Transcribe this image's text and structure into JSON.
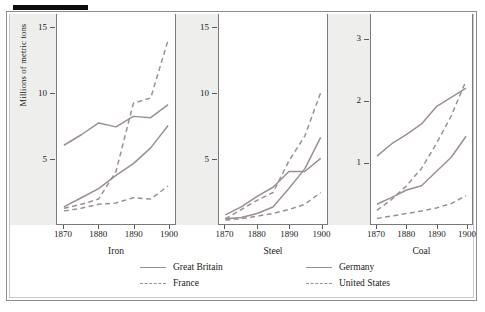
{
  "figure": {
    "ylabel": "Millions of metric tons"
  },
  "legend": {
    "entries": [
      {
        "name": "Great Britain",
        "style": "solid",
        "color": "#9b8f93"
      },
      {
        "name": "Germany",
        "style": "solid",
        "color": "#9b8f93"
      },
      {
        "name": "France",
        "style": "dashed",
        "color": "#9b8f93"
      },
      {
        "name": "United States",
        "style": "dashed",
        "color": "#9b8f93"
      }
    ]
  },
  "chart_data": {
    "type": "line",
    "title": "",
    "subtitle": "",
    "xlabel": "",
    "ylabel": "Millions of metric tons",
    "grid": false,
    "legend_position": "bottom",
    "panel_layout": "small-multiples-horizontal",
    "x": [
      1870,
      1875,
      1880,
      1885,
      1890,
      1895,
      1900
    ],
    "xlim": [
      1868,
      1902
    ],
    "xticks": [
      1870,
      1880,
      1890,
      1900
    ],
    "panels": [
      {
        "name": "Iron",
        "ylim": [
          0,
          16
        ],
        "yticks": [
          5,
          10,
          15
        ],
        "series": [
          {
            "name": "Great Britain",
            "style": "solid",
            "values": [
              6.0,
              6.8,
              7.7,
              7.4,
              8.2,
              8.1,
              9.1
            ]
          },
          {
            "name": "Germany",
            "style": "solid",
            "values": [
              1.3,
              2.0,
              2.7,
              3.7,
              4.6,
              5.8,
              7.5
            ]
          },
          {
            "name": "France",
            "style": "dashed",
            "values": [
              1.2,
              1.5,
              1.9,
              4.0,
              9.2,
              9.6,
              14.0
            ]
          },
          {
            "name": "United States",
            "style": "dashed",
            "values": [
              1.0,
              1.2,
              1.5,
              1.6,
              2.0,
              1.9,
              2.9
            ]
          }
        ]
      },
      {
        "name": "Steel",
        "ylim": [
          0,
          16
        ],
        "yticks": [
          5,
          10,
          15
        ],
        "series": [
          {
            "name": "Great Britain",
            "style": "solid",
            "values": [
              0.7,
              1.3,
              2.1,
              2.8,
              4.0,
              4.0,
              5.0
            ]
          },
          {
            "name": "Germany",
            "style": "solid",
            "values": [
              0.4,
              0.5,
              0.8,
              1.3,
              2.7,
              4.2,
              6.6
            ]
          },
          {
            "name": "France",
            "style": "dashed",
            "values": [
              0.4,
              1.1,
              1.8,
              2.4,
              4.8,
              6.7,
              10.0
            ]
          },
          {
            "name": "United States",
            "style": "dashed",
            "values": [
              0.3,
              0.4,
              0.6,
              0.8,
              1.1,
              1.5,
              2.4
            ]
          }
        ]
      },
      {
        "name": "Coal",
        "ylim": [
          0,
          3.4
        ],
        "yticks": [
          1,
          2,
          3
        ],
        "series": [
          {
            "name": "Great Britain",
            "style": "solid",
            "values": [
              1.1,
              1.3,
              1.45,
              1.62,
              1.9,
              2.05,
              2.2
            ]
          },
          {
            "name": "Germany",
            "style": "solid",
            "values": [
              0.32,
              0.43,
              0.55,
              0.62,
              0.85,
              1.08,
              1.42
            ]
          },
          {
            "name": "France",
            "style": "dashed",
            "values": [
              0.22,
              0.4,
              0.62,
              0.9,
              1.3,
              1.75,
              2.32
            ]
          },
          {
            "name": "United States",
            "style": "dashed",
            "values": [
              0.09,
              0.13,
              0.17,
              0.21,
              0.26,
              0.33,
              0.46
            ]
          }
        ]
      }
    ]
  }
}
